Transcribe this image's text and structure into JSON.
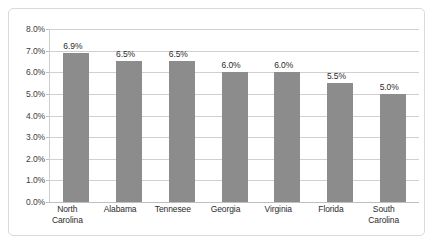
{
  "chart_data": {
    "type": "bar",
    "title": "",
    "subtitle": "",
    "xlabel": "",
    "ylabel": "",
    "categories": [
      "North Carolina",
      "Alabama",
      "Tennesee",
      "Georgia",
      "Virginia",
      "Florida",
      "South Carolina"
    ],
    "category_lines": [
      [
        "North",
        "Carolina"
      ],
      [
        "Alabama"
      ],
      [
        "Tennesee"
      ],
      [
        "Georgia"
      ],
      [
        "Virginia"
      ],
      [
        "Florida"
      ],
      [
        "South",
        "Carolina"
      ]
    ],
    "values": [
      6.9,
      6.5,
      6.5,
      6.0,
      6.0,
      5.5,
      5.0
    ],
    "data_labels": [
      "6.9%",
      "6.5%",
      "6.5%",
      "6.0%",
      "6.0%",
      "5.5%",
      "5.0%"
    ],
    "ylim": [
      0,
      8
    ],
    "ytick_values": [
      8.0,
      7.0,
      6.0,
      5.0,
      4.0,
      3.0,
      2.0,
      1.0,
      0.0
    ],
    "ytick_labels": [
      "8.0%",
      "7.0%",
      "6.0%",
      "5.0%",
      "4.0%",
      "3.0%",
      "2.0%",
      "1.0%",
      "0.0%"
    ],
    "grid": true,
    "legend": false,
    "legend_position": "none",
    "colors": {
      "bar": "#8c8c8c",
      "gridline": "#d0d0d0",
      "axis": "#bfbfbf",
      "frame": "#d9d9d9",
      "text": "#2b2b2b",
      "background": "#ffffff"
    }
  }
}
